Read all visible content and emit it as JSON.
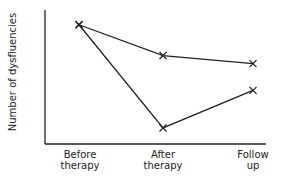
{
  "chart_data": {
    "type": "line",
    "title": "",
    "xlabel": "",
    "ylabel": "Number of dysfluencies",
    "categories": [
      "Before therapy",
      "After therapy",
      "Follow up"
    ],
    "category_lines": [
      [
        "Before",
        "therapy"
      ],
      [
        "After",
        "therapy"
      ],
      [
        "Follow",
        "up"
      ]
    ],
    "series": [
      {
        "name": "Series A (upper)",
        "values": [
          8.9,
          6.6,
          6.0
        ]
      },
      {
        "name": "Series B (lower)",
        "values": [
          8.9,
          1.2,
          4.0
        ]
      }
    ],
    "ylim": [
      0,
      10
    ],
    "y_ticks_shown": false,
    "grid": false,
    "legend": "none",
    "marker": "x",
    "line_color": "#222222"
  }
}
